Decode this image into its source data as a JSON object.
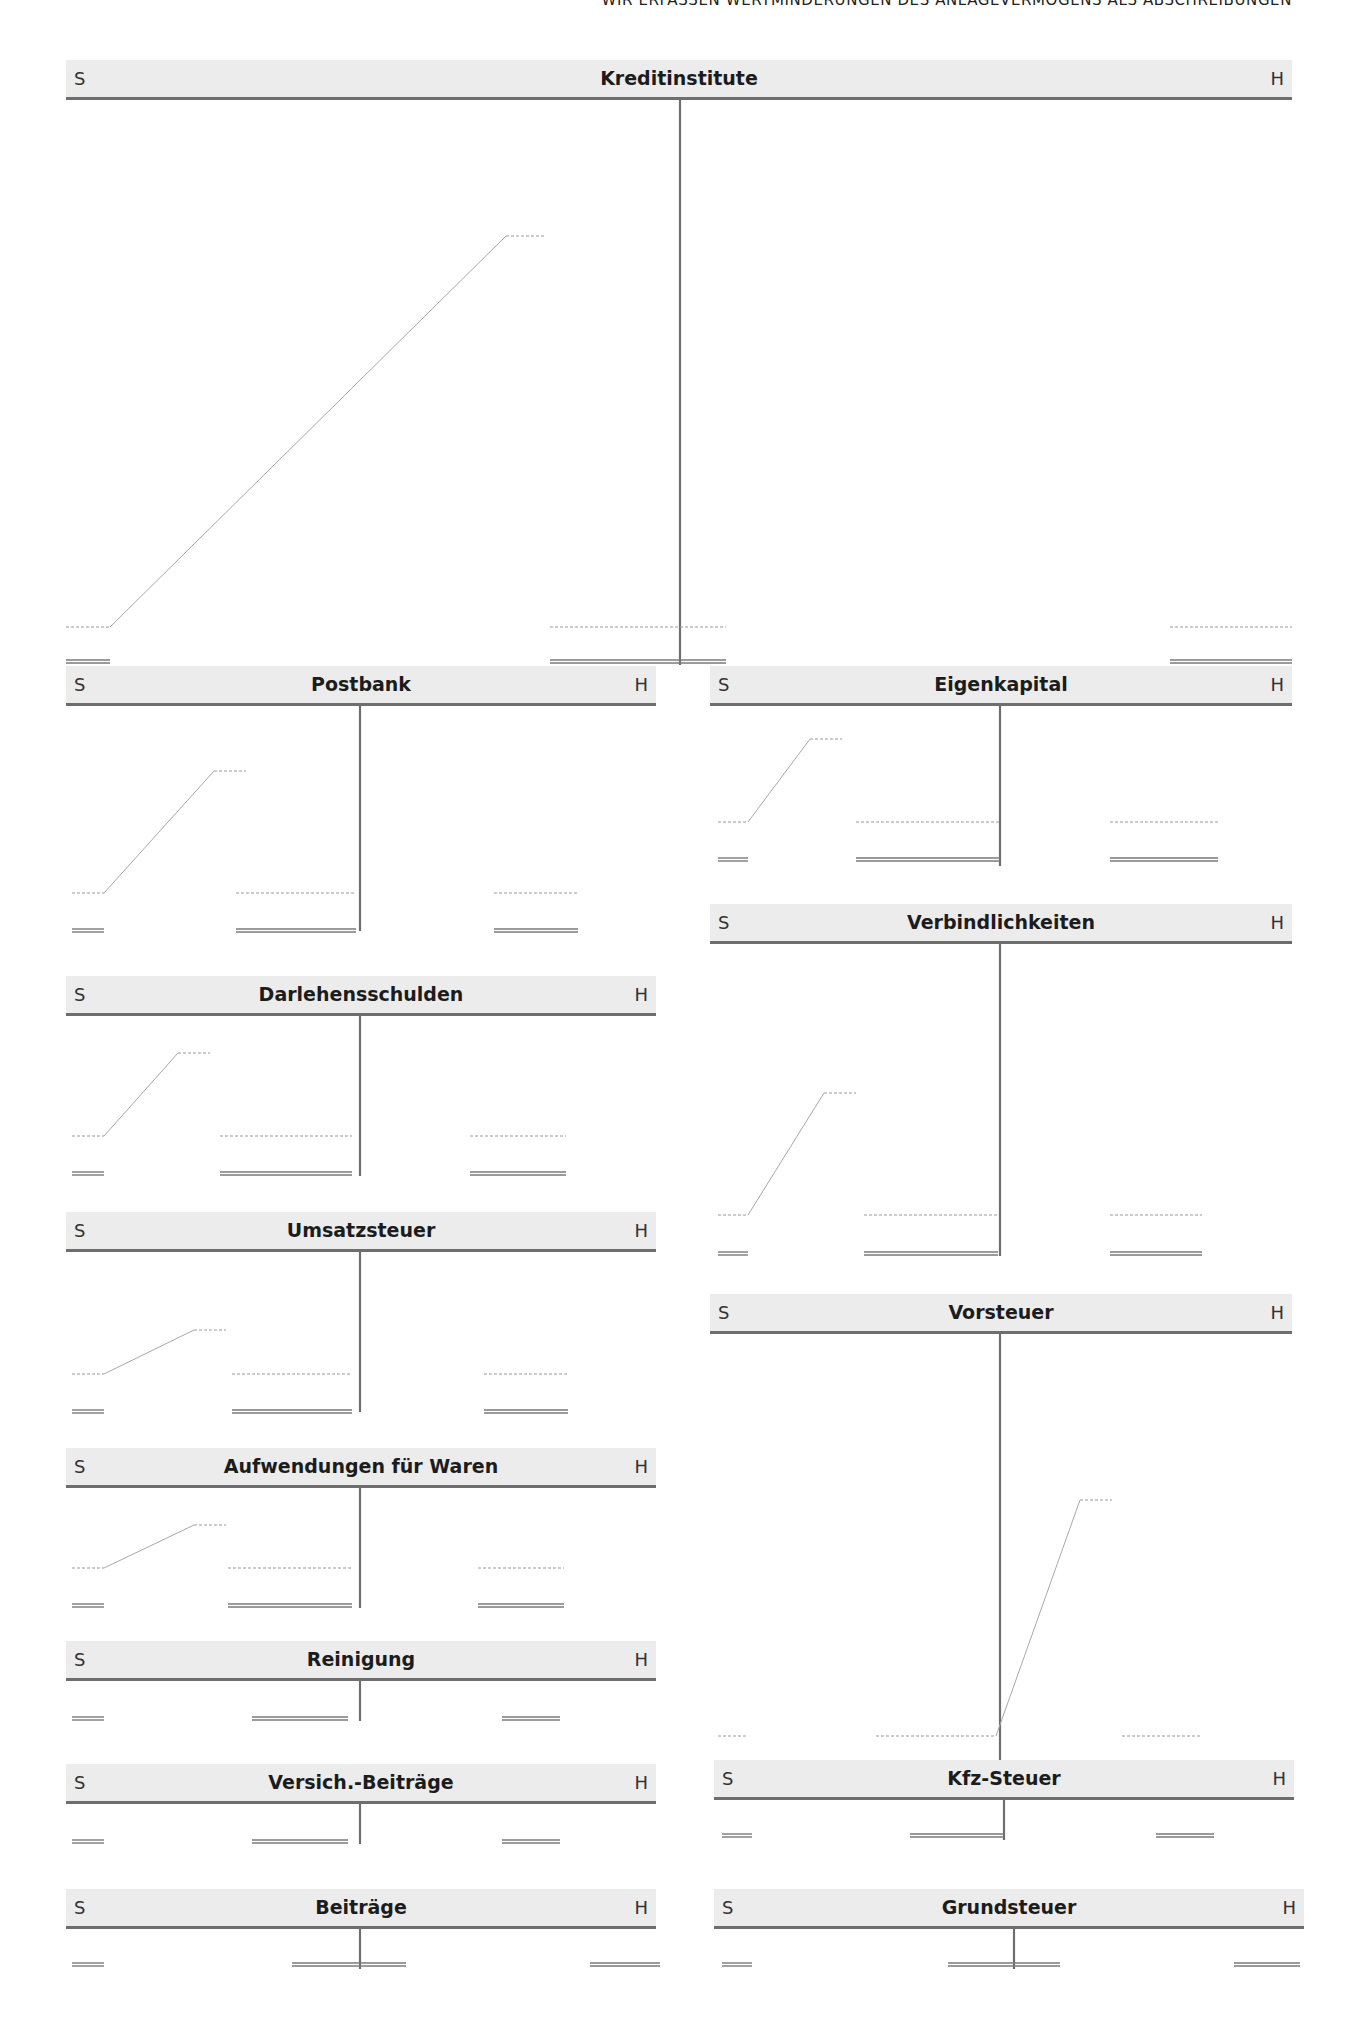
{
  "running_head": "Wir erfassen Wertminderungen des Anlagevermögens als Abschreibungen",
  "side_labels": {
    "debit": "S",
    "credit": "H"
  },
  "accounts": [
    {
      "id": "kreditinstitute",
      "title": "Kreditinstitute",
      "x": 66,
      "y": 60,
      "w": 1226,
      "body_h": 565,
      "split": 614,
      "left_dash": {
        "y": 527,
        "x1": 0,
        "x2": 44
      },
      "left_total": {
        "y": 562,
        "x1": 0,
        "x2": 44
      },
      "slash": {
        "x1": 44,
        "y1": 527,
        "x2": 440,
        "y2": 136,
        "top_dash_x2": 480
      },
      "mid_dash": {
        "y": 527,
        "x1": 484,
        "x2": 660
      },
      "mid_total": {
        "y": 562,
        "x1": 484,
        "x2": 660
      },
      "right_dash": {
        "y": 527,
        "x1": 1104,
        "x2": 1226
      },
      "right_total": {
        "y": 562,
        "x1": 1104,
        "x2": 1226
      }
    },
    {
      "id": "postbank",
      "title": "Postbank",
      "x": 66,
      "y": 666,
      "w": 590,
      "body_h": 225,
      "split": 294,
      "left_dash": {
        "y": 187,
        "x1": 6,
        "x2": 38
      },
      "left_total": {
        "y": 225,
        "x1": 6,
        "x2": 38
      },
      "slash": {
        "x1": 38,
        "y1": 187,
        "x2": 148,
        "y2": 65,
        "top_dash_x2": 180
      },
      "mid_dash": {
        "y": 187,
        "x1": 170,
        "x2": 290
      },
      "mid_total": {
        "y": 225,
        "x1": 170,
        "x2": 290
      },
      "right_dash": {
        "y": 187,
        "x1": 428,
        "x2": 512
      },
      "right_total": {
        "y": 225,
        "x1": 428,
        "x2": 512
      }
    },
    {
      "id": "darlehensschulden",
      "title": "Darlehensschulden",
      "x": 66,
      "y": 976,
      "w": 590,
      "body_h": 160,
      "split": 294,
      "left_dash": {
        "y": 120,
        "x1": 6,
        "x2": 38
      },
      "left_total": {
        "y": 158,
        "x1": 6,
        "x2": 38
      },
      "slash": {
        "x1": 38,
        "y1": 120,
        "x2": 112,
        "y2": 37,
        "top_dash_x2": 144
      },
      "mid_dash": {
        "y": 120,
        "x1": 154,
        "x2": 286
      },
      "mid_total": {
        "y": 158,
        "x1": 154,
        "x2": 286
      },
      "right_dash": {
        "y": 120,
        "x1": 404,
        "x2": 500
      },
      "right_total": {
        "y": 158,
        "x1": 404,
        "x2": 500
      }
    },
    {
      "id": "umsatzsteuer",
      "title": "Umsatzsteuer",
      "x": 66,
      "y": 1212,
      "w": 590,
      "body_h": 160,
      "split": 294,
      "left_dash": {
        "y": 122,
        "x1": 6,
        "x2": 38
      },
      "left_total": {
        "y": 160,
        "x1": 6,
        "x2": 38
      },
      "slash": {
        "x1": 38,
        "y1": 122,
        "x2": 128,
        "y2": 78,
        "top_dash_x2": 160
      },
      "mid_dash": {
        "y": 122,
        "x1": 166,
        "x2": 286
      },
      "mid_total": {
        "y": 160,
        "x1": 166,
        "x2": 286
      },
      "right_dash": {
        "y": 122,
        "x1": 418,
        "x2": 502
      },
      "right_total": {
        "y": 160,
        "x1": 418,
        "x2": 502
      }
    },
    {
      "id": "aufwendungen-fuer-waren",
      "title": "Aufwendungen für Waren",
      "x": 66,
      "y": 1448,
      "w": 590,
      "body_h": 120,
      "split": 294,
      "left_dash": {
        "y": 80,
        "x1": 6,
        "x2": 38
      },
      "left_total": {
        "y": 118,
        "x1": 6,
        "x2": 38
      },
      "slash": {
        "x1": 38,
        "y1": 80,
        "x2": 128,
        "y2": 37,
        "top_dash_x2": 160
      },
      "mid_dash": {
        "y": 80,
        "x1": 162,
        "x2": 286
      },
      "mid_total": {
        "y": 118,
        "x1": 162,
        "x2": 286
      },
      "right_dash": {
        "y": 80,
        "x1": 412,
        "x2": 498
      },
      "right_total": {
        "y": 118,
        "x1": 412,
        "x2": 498
      }
    },
    {
      "id": "reinigung",
      "title": "Reinigung",
      "x": 66,
      "y": 1641,
      "w": 590,
      "body_h": 40,
      "split": 294,
      "left_total": {
        "y": 38,
        "x1": 6,
        "x2": 38
      },
      "mid_total": {
        "y": 38,
        "x1": 186,
        "x2": 282
      },
      "right_total": {
        "y": 38,
        "x1": 436,
        "x2": 494
      }
    },
    {
      "id": "versich-beitraege",
      "title": "Versich.-Beiträge",
      "x": 66,
      "y": 1764,
      "w": 590,
      "body_h": 40,
      "split": 294,
      "left_total": {
        "y": 38,
        "x1": 6,
        "x2": 38
      },
      "mid_total": {
        "y": 38,
        "x1": 186,
        "x2": 282
      },
      "right_total": {
        "y": 38,
        "x1": 436,
        "x2": 494
      }
    },
    {
      "id": "beitraege",
      "title": "Beiträge",
      "x": 66,
      "y": 1889,
      "w": 590,
      "body_h": 40,
      "split": 294,
      "left_total": {
        "y": 36,
        "x1": 6,
        "x2": 38
      },
      "mid_total": {
        "y": 36,
        "x1": 226,
        "x2": 340
      },
      "right_total": {
        "y": 36,
        "x1": 524,
        "x2": 594
      }
    },
    {
      "id": "eigenkapital",
      "title": "Eigenkapital",
      "x": 710,
      "y": 666,
      "w": 582,
      "body_h": 160,
      "split": 290,
      "left_dash": {
        "y": 116,
        "x1": 8,
        "x2": 38
      },
      "left_total": {
        "y": 154,
        "x1": 8,
        "x2": 38
      },
      "slash": {
        "x1": 38,
        "y1": 116,
        "x2": 100,
        "y2": 33,
        "top_dash_x2": 132
      },
      "mid_dash": {
        "y": 116,
        "x1": 146,
        "x2": 290
      },
      "mid_total": {
        "y": 154,
        "x1": 146,
        "x2": 290
      },
      "right_dash": {
        "y": 116,
        "x1": 400,
        "x2": 508
      },
      "right_total": {
        "y": 154,
        "x1": 400,
        "x2": 508
      }
    },
    {
      "id": "verbindlichkeiten",
      "title": "Verbindlichkeiten",
      "x": 710,
      "y": 904,
      "w": 582,
      "body_h": 312,
      "split": 290,
      "left_dash": {
        "y": 271,
        "x1": 8,
        "x2": 38
      },
      "left_total": {
        "y": 310,
        "x1": 8,
        "x2": 38
      },
      "slash": {
        "x1": 38,
        "y1": 271,
        "x2": 114,
        "y2": 149,
        "top_dash_x2": 146
      },
      "mid_dash": {
        "y": 271,
        "x1": 154,
        "x2": 288
      },
      "mid_total": {
        "y": 310,
        "x1": 154,
        "x2": 288
      },
      "right_dash": {
        "y": 271,
        "x1": 400,
        "x2": 492
      },
      "right_total": {
        "y": 310,
        "x1": 400,
        "x2": 492
      }
    },
    {
      "id": "vorsteuer",
      "title": "Vorsteuer",
      "x": 710,
      "y": 1294,
      "w": 582,
      "body_h": 440,
      "split": 290,
      "left_dash": {
        "y": 402,
        "x1": 8,
        "x2": 38
      },
      "left_total": {
        "y": 440,
        "x1": 8,
        "x2": 38
      },
      "mid_dash": {
        "y": 402,
        "x1": 166,
        "x2": 286
      },
      "mid_total": {
        "y": 440,
        "x1": 166,
        "x2": 286
      },
      "slash": {
        "x1": 286,
        "y1": 402,
        "x2": 370,
        "y2": 166,
        "top_dash_x2": 402
      },
      "right_dash": {
        "y": 402,
        "x1": 412,
        "x2": 490
      },
      "right_total": {
        "y": 440,
        "x1": 412,
        "x2": 490
      }
    },
    {
      "id": "kfz-steuer",
      "title": "Kfz-Steuer",
      "x": 714,
      "y": 1760,
      "w": 580,
      "body_h": 40,
      "split": 290,
      "left_total": {
        "y": 36,
        "x1": 8,
        "x2": 38
      },
      "mid_total": {
        "y": 36,
        "x1": 196,
        "x2": 290
      },
      "right_total": {
        "y": 36,
        "x1": 442,
        "x2": 500
      }
    },
    {
      "id": "grundsteuer",
      "title": "Grundsteuer",
      "x": 714,
      "y": 1889,
      "w": 590,
      "body_h": 40,
      "split": 300,
      "left_total": {
        "y": 36,
        "x1": 8,
        "x2": 38
      },
      "mid_total": {
        "y": 36,
        "x1": 234,
        "x2": 346
      },
      "right_total": {
        "y": 36,
        "x1": 520,
        "x2": 586
      }
    }
  ],
  "colors": {
    "header_bg": "#ececec",
    "rule": "#6e6e6e",
    "dash": "#9a9a9a",
    "slash": "#a8a8a8",
    "total": "#7a7a7a"
  }
}
